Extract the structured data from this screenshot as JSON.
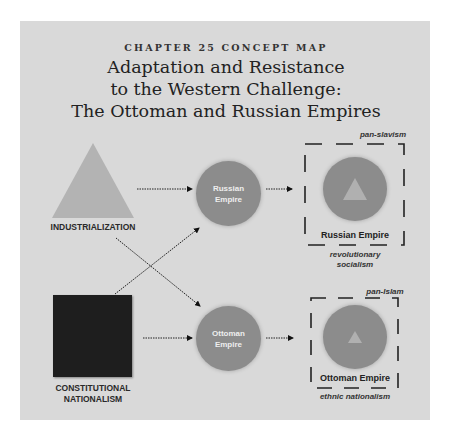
{
  "header": {
    "kicker": "CHAPTER 25 CONCEPT MAP",
    "title_lines": [
      "Adaptation and Resistance",
      "to the Western Challenge:",
      "The Ottoman and Russian Empires"
    ]
  },
  "inputs": [
    {
      "label": "INDUSTRIALIZATION",
      "shape": "triangle",
      "color": "#b3b3b3"
    },
    {
      "label_lines": [
        "CONSTITUTIONAL",
        "NATIONALISM"
      ],
      "shape": "square",
      "color": "#1e1e1e"
    }
  ],
  "empires": [
    {
      "label_lines": [
        "Russian",
        "Empire"
      ],
      "color": "#8c8c8c"
    },
    {
      "label_lines": [
        "Ottoman",
        "Empire"
      ],
      "color": "#8c8c8c"
    }
  ],
  "outcomes": [
    {
      "label": "Russian Empire",
      "top_note": "pan-slavism",
      "bottom_note_lines": [
        "revolutionary",
        "socialism"
      ]
    },
    {
      "label": "Ottoman Empire",
      "top_note": "pan-Islam",
      "bottom_note_lines": [
        "ethnic nationalism"
      ]
    }
  ],
  "connections": [
    {
      "from": "INDUSTRIALIZATION",
      "to": "Russian Empire"
    },
    {
      "from": "INDUSTRIALIZATION",
      "to": "Ottoman Empire"
    },
    {
      "from": "CONSTITUTIONAL NATIONALISM",
      "to": "Russian Empire"
    },
    {
      "from": "CONSTITUTIONAL NATIONALISM",
      "to": "Ottoman Empire"
    },
    {
      "from": "Russian Empire",
      "to": "Russian Empire outcome"
    },
    {
      "from": "Ottoman Empire",
      "to": "Ottoman Empire outcome"
    }
  ]
}
